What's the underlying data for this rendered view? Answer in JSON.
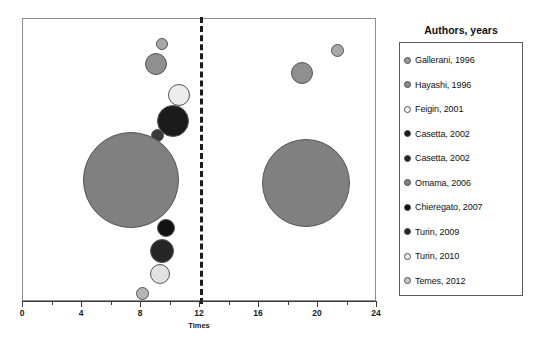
{
  "chart_data": {
    "type": "scatter",
    "title": "",
    "xlabel": "Times",
    "ylabel": "",
    "xlim": [
      0,
      24
    ],
    "xticks": [
      0,
      4,
      8,
      12,
      16,
      20,
      24
    ],
    "xtick_labels": [
      "0",
      "4",
      "8",
      "12",
      "16",
      "20",
      "24"
    ],
    "minor_xticks": [
      2,
      6,
      10,
      14,
      18,
      22
    ],
    "grid": false,
    "annotations": [
      {
        "name": "threshold-line",
        "type": "vertical-dashed-line",
        "x": 12
      }
    ],
    "legend": {
      "position": "right",
      "title": "Authors, years",
      "entries": [
        {
          "label": "Gallerani, 1996",
          "color": "#9a9a9a"
        },
        {
          "label": "Hayashi, 1996",
          "color": "#8a8a8a"
        },
        {
          "label": "Feigin, 2001",
          "color": "#ffffff"
        },
        {
          "label": "Casetta, 2002",
          "color": "#1a1a1a"
        },
        {
          "label": "Casetta, 2002",
          "color": "#242424"
        },
        {
          "label": "Omama, 2006",
          "color": "#808080"
        },
        {
          "label": "Chieregato, 2007",
          "color": "#121212"
        },
        {
          "label": "Turin, 2009",
          "color": "#262626"
        },
        {
          "label": "Turin, 2010",
          "color": "#eeeeee"
        },
        {
          "label": "Temes, 2012",
          "color": "#c8c8c8"
        }
      ]
    },
    "points": [
      {
        "name": "bubble-gallerani-1996-left",
        "series": "Gallerani, 1996",
        "x": 9.4,
        "y": 91,
        "size": 12,
        "color": "#a8a8a8"
      },
      {
        "name": "bubble-hayashi-1996-left",
        "series": "Hayashi, 1996",
        "x": 9.0,
        "y": 84,
        "size": 22,
        "color": "#8f8f8f"
      },
      {
        "name": "bubble-feigin-2001-left",
        "series": "Feigin, 2001",
        "x": 10.6,
        "y": 73,
        "size": 22,
        "color": "#ededed"
      },
      {
        "name": "bubble-casetta-2002a-left",
        "series": "Casetta, 2002",
        "x": 10.2,
        "y": 64,
        "size": 32,
        "color": "#1b1b1b"
      },
      {
        "name": "bubble-casetta-2002b-left",
        "series": "Casetta, 2002",
        "x": 9.1,
        "y": 59,
        "size": 13,
        "color": "#3a3a3a"
      },
      {
        "name": "bubble-omama-2006-left",
        "series": "Omama, 2006",
        "x": 7.3,
        "y": 43,
        "size": 96,
        "color": "#808080"
      },
      {
        "name": "bubble-chieregato-2007-left",
        "series": "Chieregato, 2007",
        "x": 9.7,
        "y": 26,
        "size": 18,
        "color": "#121212"
      },
      {
        "name": "bubble-turin-2009-left",
        "series": "Turin, 2009",
        "x": 9.4,
        "y": 18,
        "size": 24,
        "color": "#262626"
      },
      {
        "name": "bubble-turin-2010-left",
        "series": "Turin, 2010",
        "x": 9.3,
        "y": 10,
        "size": 20,
        "color": "#e2e2e2"
      },
      {
        "name": "bubble-temes-2012-left",
        "series": "Temes, 2012",
        "x": 8.1,
        "y": 3,
        "size": 13,
        "color": "#b4b4b4"
      },
      {
        "name": "bubble-gallerani-1996-right",
        "series": "Gallerani, 1996",
        "x": 21.3,
        "y": 89,
        "size": 13,
        "color": "#a8a8a8"
      },
      {
        "name": "bubble-hayashi-1996-right",
        "series": "Hayashi, 1996",
        "x": 18.9,
        "y": 81,
        "size": 22,
        "color": "#8f8f8f"
      },
      {
        "name": "bubble-omama-2006-right",
        "series": "Omama, 2006",
        "x": 19.2,
        "y": 42,
        "size": 88,
        "color": "#808080"
      }
    ]
  },
  "colors": {
    "frame": "#8c8c8c",
    "axis": "#3a3a3a",
    "threshold": "#1c1c1c",
    "background": "#ffffff"
  }
}
